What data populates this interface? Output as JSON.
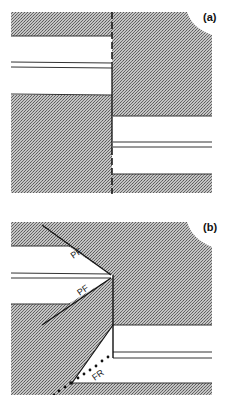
{
  "figure": {
    "panels": [
      {
        "id": "a",
        "label": "(a)",
        "description": "Offset bed across a vertical dashed fault"
      },
      {
        "id": "b",
        "label": "(b)",
        "description": "Fault geometry with PF and FR fracture labels",
        "annotations": {
          "pf_upper": "PF",
          "pf_lower": "PF",
          "fr": "FR"
        }
      }
    ],
    "colors": {
      "shading": "#9a9a9a",
      "background": "#ffffff",
      "line": "#1a1a1a"
    }
  }
}
